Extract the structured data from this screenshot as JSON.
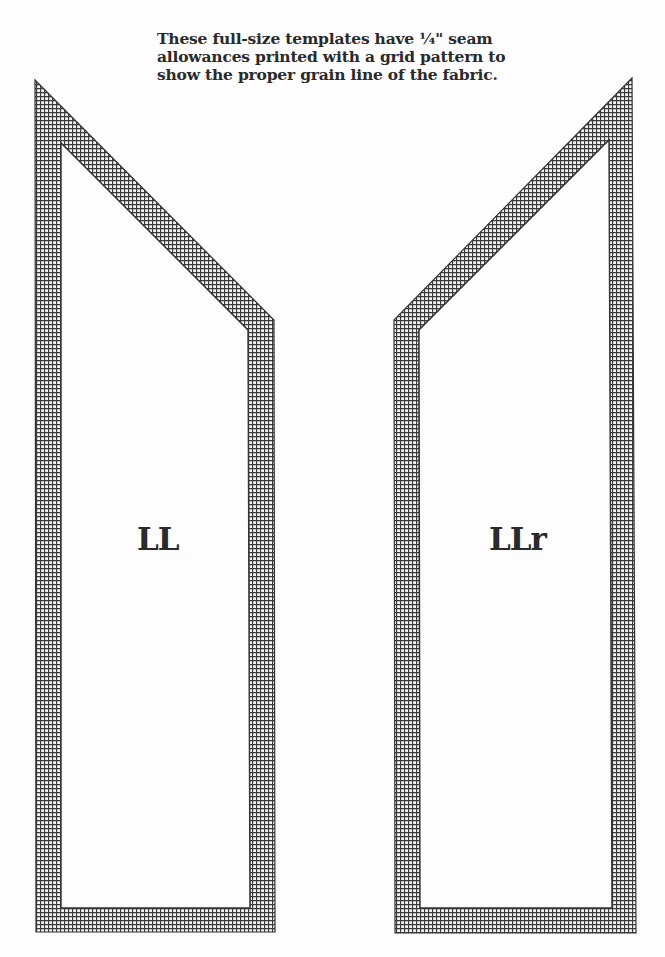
{
  "heading": {
    "lines": [
      "These full-size templates have ¼\" seam",
      "allowances printed with a grid pattern to",
      "show the proper grain line of the fabric."
    ]
  },
  "templates": [
    {
      "id": "left",
      "label": "LL",
      "outer_polygon": [
        [
          35,
          80
        ],
        [
          274,
          320
        ],
        [
          275,
          932
        ],
        [
          36,
          932
        ]
      ],
      "inner_polygon": [
        [
          61,
          143
        ],
        [
          248,
          330
        ],
        [
          250,
          908
        ],
        [
          61,
          908
        ]
      ]
    },
    {
      "id": "right",
      "label": "LLr",
      "outer_polygon": [
        [
          632,
          78
        ],
        [
          394,
          320
        ],
        [
          395,
          933
        ],
        [
          636,
          933
        ]
      ],
      "inner_polygon": [
        [
          609,
          140
        ],
        [
          419,
          330
        ],
        [
          420,
          908
        ],
        [
          612,
          908
        ]
      ]
    }
  ],
  "style": {
    "grid_line_color": "#3a3a3a",
    "grid_cell_px": 4,
    "seam_allowance_label": "¼\""
  }
}
